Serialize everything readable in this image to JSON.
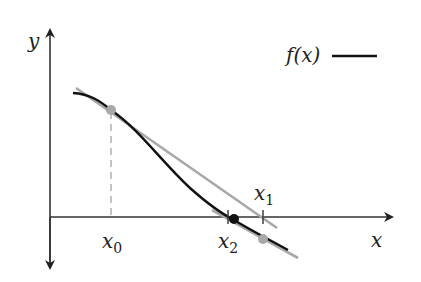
{
  "diagram": {
    "axes": {
      "x_label": "x",
      "y_label": "y"
    },
    "legend": {
      "label": "f(x)",
      "line_color": "#111111"
    },
    "ticks": [
      {
        "name": "x0",
        "base": "x",
        "sub": "0"
      },
      {
        "name": "x1",
        "base": "x",
        "sub": "1"
      },
      {
        "name": "x2",
        "base": "x",
        "sub": "2"
      }
    ],
    "colors": {
      "curve": "#111111",
      "tangent": "#a8a8a8",
      "point_gray": "#a8a8a8",
      "point_root": "#111111",
      "axis": "#333333"
    }
  }
}
